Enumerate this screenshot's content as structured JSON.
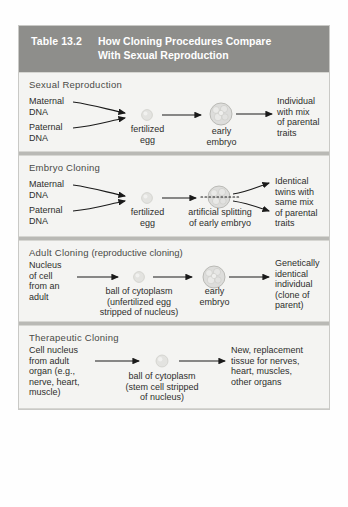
{
  "table": {
    "number": "Table 13.2",
    "title_line1": "How Cloning Procedures Compare",
    "title_line2": "With Sexual Reproduction",
    "header_bg": "#8e8e8b",
    "header_text_color": "#ffffff",
    "body_bg": "#f4f4f2"
  },
  "sections": [
    {
      "heading": "Sexual Reproduction",
      "labels": {
        "maternal": "Maternal\nDNA",
        "paternal": "Paternal\nDNA",
        "fertilized_egg": "fertilized\negg",
        "early_embryo": "early\nembryo",
        "outcome": "Individual\nwith mix\nof parental\ntraits"
      }
    },
    {
      "heading": "Embryo Cloning",
      "labels": {
        "maternal": "Maternal\nDNA",
        "paternal": "Paternal\nDNA",
        "fertilized_egg": "fertilized\negg",
        "splitting": "artificial splitting\nof early embryo",
        "outcome": "Identical\ntwins with\nsame mix\nof parental\ntraits"
      }
    },
    {
      "heading": "Adult Cloning",
      "heading_paren": " (reproductive cloning)",
      "labels": {
        "source": "Nucleus\nof cell\nfrom an\nadult",
        "cytoplasm": "ball of cytoplasm\n(unfertilized egg\nstripped of nucleus)",
        "early_embryo": "early\nembryo",
        "outcome": "Genetically\nidentical\nindividual\n(clone of\nparent)"
      }
    },
    {
      "heading": "Therapeutic Cloning",
      "labels": {
        "source": "Cell nucleus\nfrom adult\norgan (e.g.,\nnerve, heart,\nmuscle)",
        "cytoplasm": "ball of cytoplasm\n(stem cell stripped\nof nucleus)",
        "outcome": "New, replacement\ntissue for nerves,\nheart, muscles,\nother organs"
      }
    }
  ]
}
